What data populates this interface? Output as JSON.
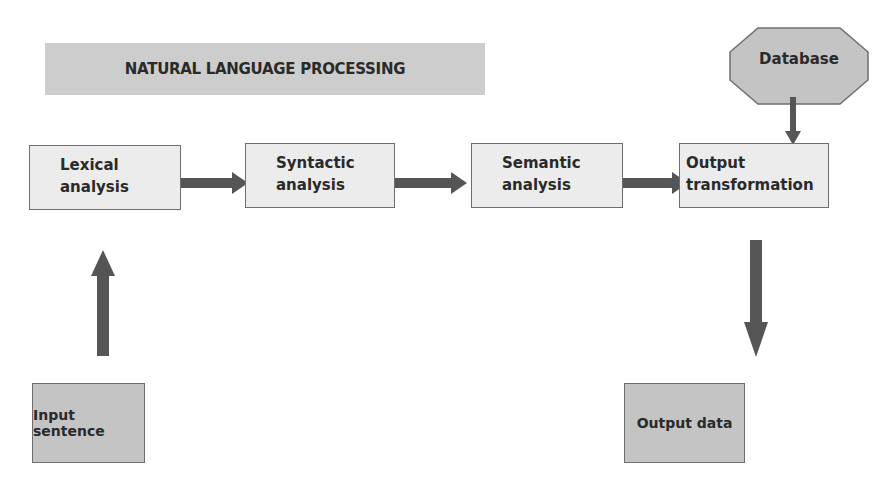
{
  "title": "NATURAL LANGUAGE PROCESSING",
  "pipeline": [
    {
      "id": "lexical",
      "line1": "Lexical",
      "line2": "analysis"
    },
    {
      "id": "syntactic",
      "line1": "Syntactic",
      "line2": "analysis"
    },
    {
      "id": "semantic",
      "line1": "Semantic",
      "line2": "analysis"
    },
    {
      "id": "output-transformation",
      "line1": "Output",
      "line2": "transformation"
    }
  ],
  "database": "Database",
  "input": "Input sentence",
  "output": "Output data",
  "colors": {
    "arrow": "#555555",
    "light_box": "#ececec",
    "dark_box": "#c4c4c4",
    "border": "#6e6e6e"
  }
}
